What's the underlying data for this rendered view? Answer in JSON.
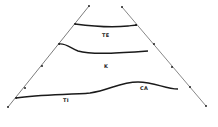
{
  "diagram": {
    "type": "schematic cross-section",
    "colors": {
      "background": "#ffffff",
      "stroke": "#1a1a1a"
    },
    "labels": {
      "te": "TE",
      "k": "K",
      "ti": "TI",
      "ca": "CA"
    },
    "left_boundary_points": [
      [
        89,
        6
      ],
      [
        75,
        24
      ],
      [
        59,
        44
      ],
      [
        42,
        66
      ],
      [
        25,
        88
      ],
      [
        16,
        98
      ],
      [
        8,
        107
      ]
    ],
    "right_boundary_points": [
      [
        122,
        7
      ],
      [
        136,
        25
      ],
      [
        154,
        44
      ],
      [
        172,
        67
      ],
      [
        190,
        87
      ],
      [
        206,
        106
      ]
    ]
  }
}
